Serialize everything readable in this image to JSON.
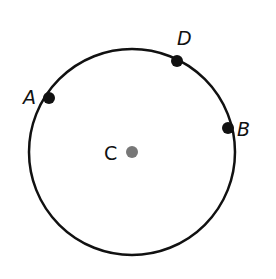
{
  "diagram": {
    "type": "circle-with-points",
    "circle": {
      "cx": 132,
      "cy": 152,
      "r": 103,
      "stroke": "#111111",
      "stroke_width": 2.5
    },
    "center": {
      "label": "C",
      "x": 132,
      "y": 152,
      "color": "#777777",
      "label_x": 104,
      "label_y": 160
    },
    "points": [
      {
        "label": "A",
        "x": 49,
        "y": 98,
        "color": "#111111",
        "label_x": 23,
        "label_y": 104
      },
      {
        "label": "D",
        "x": 177,
        "y": 61,
        "color": "#111111",
        "label_x": 177,
        "label_y": 45
      },
      {
        "label": "B",
        "x": 228,
        "y": 128,
        "color": "#111111",
        "label_x": 237,
        "label_y": 136
      }
    ]
  }
}
